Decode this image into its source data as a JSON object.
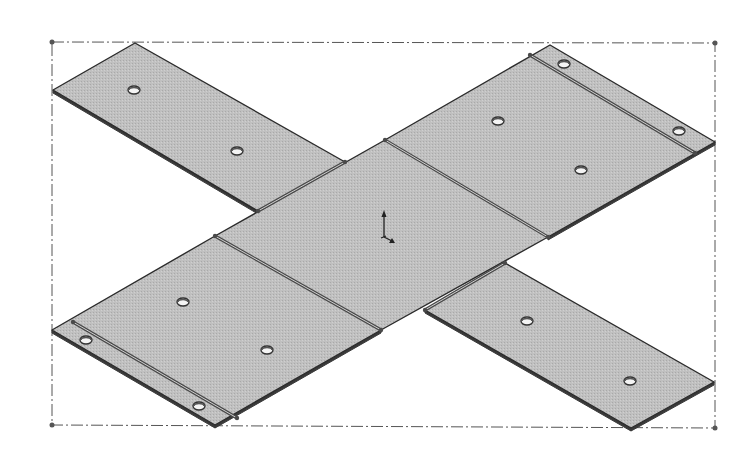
{
  "view": {
    "background": "#ffffff",
    "title": "",
    "colors": {
      "face": "#bdbdbd",
      "edge": "#2b2b2b",
      "thickness_edge": "#3a3a3a",
      "fold_line": "#4a4a4a",
      "bbox": "#555555",
      "hole_fill": "#f4f4f4",
      "hole_stroke": "#333333",
      "triad": "#222222"
    }
  },
  "bounding_box": {
    "style": "dash-dot",
    "corners": [
      [
        52,
        42
      ],
      [
        715,
        43
      ],
      [
        715,
        428
      ],
      [
        52,
        425
      ]
    ]
  },
  "panels": [
    {
      "name": "flap-top-left",
      "points": "135,43 345,162 258,211 53,90"
    },
    {
      "name": "panel-top-right",
      "points": "385,140 550,45 715,142 548,237"
    },
    {
      "name": "panel-center",
      "points": "215,236 385,140 548,237 381,330"
    },
    {
      "name": "panel-bottom-left",
      "points": "52,330 215,236 381,330 215,425"
    },
    {
      "name": "flap-bottom-right",
      "points": "425,310 505,263 714,382 631,428"
    }
  ],
  "thickness_edges": [
    "53,90 258,211 258,214 53,93",
    "548,237 715,142 715,145 548,240",
    "52,330 215,425 215,428 52,333",
    "215,425 381,330 381,333 215,428",
    "425,310 631,428 631,431 425,313",
    "631,428 714,382 714,385 631,431"
  ],
  "fold_lines": [
    {
      "name": "fold-center-top-right",
      "x1": 385,
      "y1": 140,
      "x2": 548,
      "y2": 237
    },
    {
      "name": "fold-top-right-hem",
      "x1": 530,
      "y1": 55,
      "x2": 695,
      "y2": 153
    },
    {
      "name": "fold-center-bottom-left",
      "x1": 215,
      "y1": 236,
      "x2": 381,
      "y2": 330
    },
    {
      "name": "fold-bottom-left-hem",
      "x1": 73,
      "y1": 322,
      "x2": 237,
      "y2": 418
    },
    {
      "name": "fold-top-left-flap",
      "x1": 258,
      "y1": 211,
      "x2": 345,
      "y2": 162
    },
    {
      "name": "fold-bottom-right-flap",
      "x1": 425,
      "y1": 310,
      "x2": 505,
      "y2": 263
    }
  ],
  "holes": [
    {
      "cx": 134,
      "cy": 90,
      "rx": 6,
      "ry": 4
    },
    {
      "cx": 237,
      "cy": 151,
      "rx": 6,
      "ry": 4
    },
    {
      "cx": 564,
      "cy": 64,
      "rx": 6,
      "ry": 4
    },
    {
      "cx": 498,
      "cy": 121,
      "rx": 6,
      "ry": 4
    },
    {
      "cx": 679,
      "cy": 131,
      "rx": 6,
      "ry": 4
    },
    {
      "cx": 581,
      "cy": 170,
      "rx": 6,
      "ry": 4
    },
    {
      "cx": 183,
      "cy": 302,
      "rx": 6,
      "ry": 4
    },
    {
      "cx": 267,
      "cy": 350,
      "rx": 6,
      "ry": 4
    },
    {
      "cx": 86,
      "cy": 340,
      "rx": 6,
      "ry": 4
    },
    {
      "cx": 199,
      "cy": 406,
      "rx": 6,
      "ry": 4
    },
    {
      "cx": 527,
      "cy": 321,
      "rx": 6,
      "ry": 4
    },
    {
      "cx": 630,
      "cy": 381,
      "rx": 6,
      "ry": 4
    }
  ],
  "triad": {
    "origin": [
      384,
      237
    ],
    "label": "coordinate-triad"
  }
}
